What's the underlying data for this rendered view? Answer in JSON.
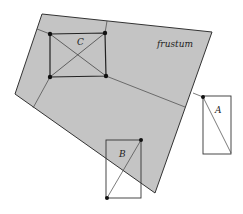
{
  "diagram": {
    "labels": {
      "frustum": "frustum",
      "a": "A",
      "b": "B",
      "c": "C"
    },
    "colors": {
      "frustum_fill": "#c4c4c4",
      "stroke": "#333333"
    }
  }
}
